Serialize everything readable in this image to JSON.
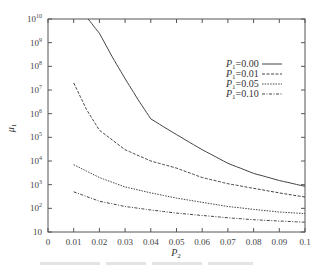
{
  "chart_data": {
    "type": "line",
    "title": "",
    "xlabel": "P_2",
    "ylabel": "μ_1",
    "xlim": [
      0,
      0.1
    ],
    "ylim": [
      10,
      10000000000
    ],
    "yscale": "log",
    "grid": false,
    "legend_position": "upper right (inside)",
    "x_ticks": [
      "0",
      "0.01",
      "0.02",
      "0.03",
      "0.04",
      "0.05",
      "0.06",
      "0.07",
      "0.08",
      "0.09",
      "0.1"
    ],
    "y_ticks": [
      "10",
      "10^2",
      "10^3",
      "10^4",
      "10^5",
      "10^6",
      "10^7",
      "10^8",
      "10^9",
      "10^10"
    ],
    "series": [
      {
        "name": "P1=0.00",
        "style": "solid",
        "x": [
          0.0156,
          0.02,
          0.025,
          0.03,
          0.035,
          0.04,
          0.05,
          0.06,
          0.07,
          0.08,
          0.09,
          0.1
        ],
        "values": [
          10000000000,
          2500000000,
          250000000,
          30000000,
          4000000,
          600000,
          130000,
          30000,
          8000,
          3000,
          1500,
          850
        ]
      },
      {
        "name": "P1=0.01",
        "style": "dashed",
        "x": [
          0.01,
          0.015,
          0.02,
          0.03,
          0.04,
          0.05,
          0.06,
          0.07,
          0.08,
          0.09,
          0.1
        ],
        "values": [
          20000000,
          1500000,
          200000,
          30000,
          10000,
          5000,
          2000,
          1100,
          700,
          450,
          300
        ]
      },
      {
        "name": "P1=0.05",
        "style": "dotted",
        "x": [
          0.01,
          0.02,
          0.03,
          0.04,
          0.05,
          0.06,
          0.07,
          0.08,
          0.09,
          0.1
        ],
        "values": [
          7000,
          2000,
          800,
          450,
          270,
          180,
          120,
          90,
          70,
          60
        ]
      },
      {
        "name": "P1=0.10",
        "style": "dash-dot",
        "x": [
          0.01,
          0.02,
          0.03,
          0.04,
          0.05,
          0.06,
          0.07,
          0.08,
          0.09,
          0.1
        ],
        "values": [
          500,
          200,
          120,
          85,
          63,
          50,
          40,
          33,
          29,
          26
        ]
      }
    ]
  },
  "labels": {
    "xlabel_main": "P",
    "xlabel_sub": "2",
    "ylabel_main": "μ",
    "ylabel_sub": "1",
    "legend": [
      {
        "main": "P",
        "sub": "1",
        "rest": "=0.00"
      },
      {
        "main": "P",
        "sub": "1",
        "rest": "=0.01"
      },
      {
        "main": "P",
        "sub": "1",
        "rest": "=0.05"
      },
      {
        "main": "P",
        "sub": "1",
        "rest": "=0.10"
      }
    ]
  }
}
